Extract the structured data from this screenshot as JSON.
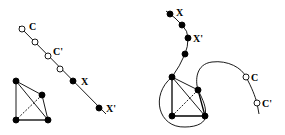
{
  "diagram": {
    "panels": [
      {
        "name": "left",
        "labels": {
          "c": "C",
          "c_prime": "C'",
          "x": "X",
          "x_prime": "X'"
        },
        "path_nodes": [
          {
            "x": 22,
            "y": 29,
            "type": "open"
          },
          {
            "x": 35,
            "y": 42,
            "type": "open"
          },
          {
            "x": 48,
            "y": 56,
            "type": "open"
          },
          {
            "x": 60,
            "y": 69,
            "type": "open"
          },
          {
            "x": 73,
            "y": 81,
            "type": "filled"
          },
          {
            "x": 99,
            "y": 108,
            "type": "filled"
          }
        ],
        "k4_nodes": [
          [
            16,
            81
          ],
          [
            42,
            95
          ],
          [
            16,
            120
          ],
          [
            48,
            120
          ]
        ]
      },
      {
        "name": "right",
        "labels": {
          "c": "C",
          "c_prime": "C'",
          "x": "X",
          "x_prime": "X'"
        },
        "path_nodes": [
          {
            "x": 170,
            "y": 14,
            "type": "filled"
          },
          {
            "x": 182,
            "y": 25,
            "type": "filled"
          },
          {
            "x": 188,
            "y": 38,
            "type": "filled"
          },
          {
            "x": 185,
            "y": 54,
            "type": "filled"
          },
          {
            "x": 246,
            "y": 77,
            "type": "open"
          },
          {
            "x": 257,
            "y": 103,
            "type": "open"
          }
        ],
        "k4_nodes": [
          [
            172,
            77
          ],
          [
            198,
            90
          ],
          [
            172,
            116
          ],
          [
            205,
            116
          ]
        ]
      }
    ],
    "colors": {
      "stroke": "#000000",
      "background": "#ffffff"
    }
  }
}
